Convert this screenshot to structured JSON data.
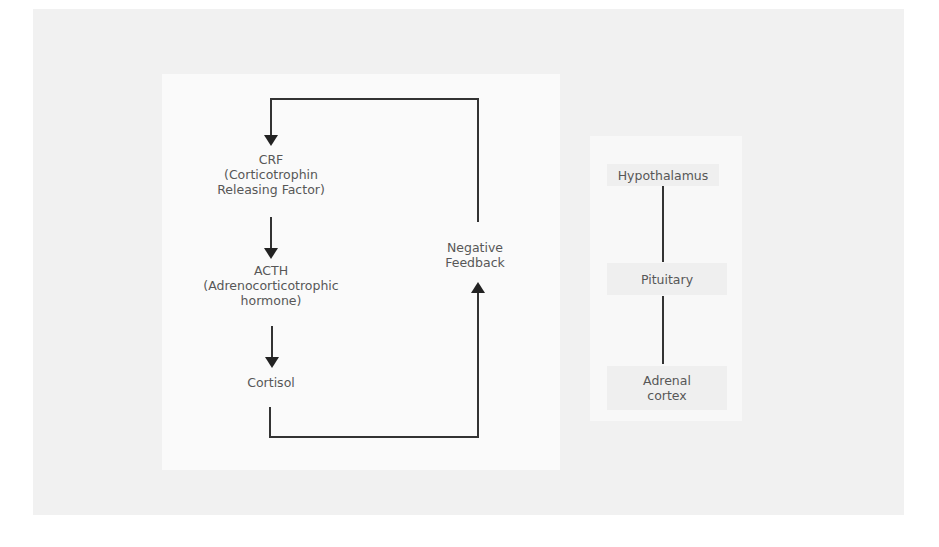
{
  "diagram": {
    "flow": {
      "crf": {
        "title": "CRF",
        "line1": "(Corticotrophin",
        "line2": "Releasing Factor)"
      },
      "acth": {
        "title": "ACTH",
        "line1": "(Adrenocorticotrophic",
        "line2": "hormone)"
      },
      "cortisol": {
        "title": "Cortisol"
      },
      "feedback": {
        "line1": "Negative",
        "line2": "Feedback"
      }
    },
    "axis": {
      "items": [
        {
          "label": "Hypothalamus"
        },
        {
          "label": "Pituitary"
        },
        {
          "line1": "Adrenal",
          "line2": "cortex"
        }
      ]
    },
    "colors": {
      "line": "#333333",
      "text": "#575757",
      "background": "#f1f1f1"
    }
  }
}
